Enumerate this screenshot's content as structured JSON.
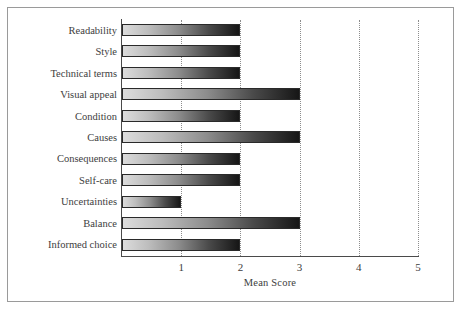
{
  "figure": {
    "frame_border_color": "#9a9a9a",
    "background_color": "#ffffff"
  },
  "chart_data": {
    "type": "bar",
    "orientation": "horizontal",
    "title": "",
    "xlabel": "Mean Score",
    "ylabel": "",
    "xlim": [
      0,
      5
    ],
    "ylim": null,
    "grid": true,
    "grid_axis": "x",
    "grid_style": "dotted",
    "legend": false,
    "legend_position": "none",
    "xticks": [
      1,
      2,
      3,
      4,
      5
    ],
    "xtick_labels": [
      "1",
      "2",
      "3",
      "4",
      "5"
    ],
    "categories": [
      "Readability",
      "Style",
      "Technical terms",
      "Visual appeal",
      "Condition",
      "Causes",
      "Consequences",
      "Self-care",
      "Uncertainties",
      "Balance",
      "Informed choice"
    ],
    "values": [
      2,
      2,
      2,
      3,
      2,
      3,
      2,
      2,
      1,
      3,
      2
    ],
    "bar_fill": "gradient",
    "bar_gradient_from": "#dcdcdc",
    "bar_gradient_to": "#161616",
    "bar_edge_color": "#2a2a2a",
    "axis_color": "#4a4a4a",
    "text_color": "#3d3d3d"
  }
}
